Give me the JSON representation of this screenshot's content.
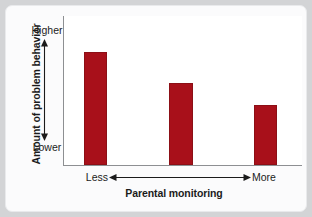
{
  "chart_data": {
    "type": "bar",
    "title": "",
    "subtitle": "",
    "xlabel": "Parental monitoring",
    "ylabel": "Amount of problem behavior",
    "x_axis_low_label": "Less",
    "x_axis_high_label": "More",
    "y_axis_low_label": "Lower",
    "y_axis_high_label": "Higher",
    "categories": [
      "Less",
      "Moderate",
      "More"
    ],
    "values": [
      76,
      55,
      40
    ],
    "ylim": [
      0,
      100
    ],
    "xlim": [
      0,
      3
    ],
    "grid": false,
    "legend": null,
    "tick_labels_x": [
      "",
      "",
      ""
    ],
    "tick_labels_y": [
      "Lower",
      "Higher"
    ],
    "annotations": [
      "Vertical double-headed arrow between Lower and Higher",
      "Horizontal double-headed arrow between Less and More"
    ],
    "bar_color": "#a8101a",
    "bar_edge_color": "#8c0f16",
    "plot_background": "#ffffff",
    "axis_color": "#8d8f92",
    "page_background": "#d3d4d6",
    "card_background": "#fbfbfc"
  },
  "figure": {
    "y_axis_title": "Amount of problem behavior",
    "y_high": "Higher",
    "y_low": "Lower",
    "x_axis_title": "Parental monitoring",
    "x_low": "Less",
    "x_high": "More"
  }
}
